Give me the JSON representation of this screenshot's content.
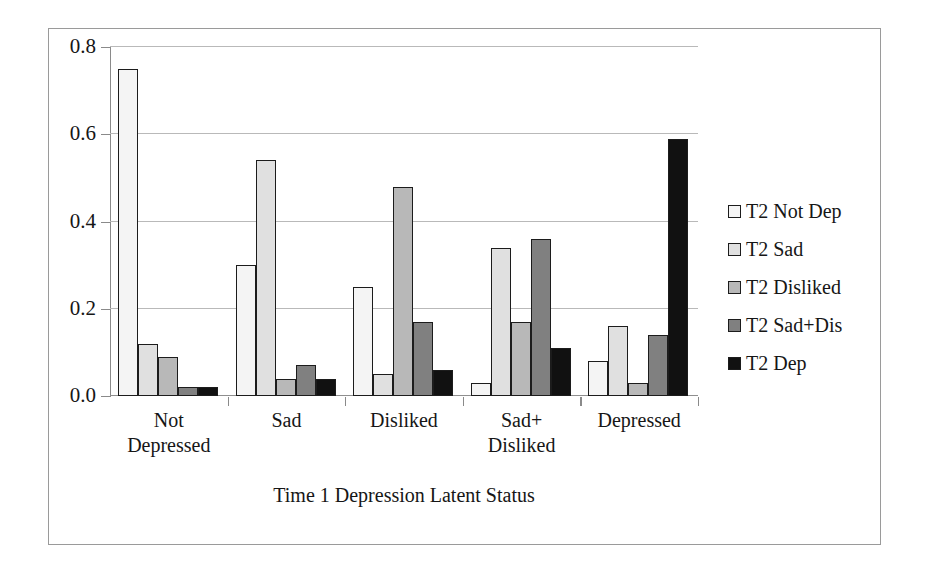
{
  "chart_data": {
    "type": "bar",
    "title": "",
    "xlabel": "Time 1 Depression Latent Status",
    "ylabel": "",
    "ylim": [
      0.0,
      0.8
    ],
    "yticks": [
      "0.0",
      "0.2",
      "0.4",
      "0.6",
      "0.8"
    ],
    "ytick_values": [
      0.0,
      0.2,
      0.4,
      0.6,
      0.8
    ],
    "grid": true,
    "legend_position": "right",
    "categories": [
      "Not Depressed",
      "Sad",
      "Disliked",
      "Sad+ Disliked",
      "Depressed"
    ],
    "category_lines": [
      [
        "Not",
        "Depressed"
      ],
      [
        "Sad",
        ""
      ],
      [
        "Disliked",
        ""
      ],
      [
        "Sad+",
        "Disliked"
      ],
      [
        "Depressed",
        ""
      ]
    ],
    "series": [
      {
        "name": "T2 Not Dep",
        "color": "#f4f4f4",
        "values": [
          0.75,
          0.3,
          0.25,
          0.03,
          0.08
        ]
      },
      {
        "name": "T2 Sad",
        "color": "#e0e0e0",
        "values": [
          0.12,
          0.54,
          0.05,
          0.34,
          0.16
        ]
      },
      {
        "name": "T2 Disliked",
        "color": "#b8b8b8",
        "values": [
          0.09,
          0.04,
          0.48,
          0.17,
          0.03
        ]
      },
      {
        "name": "T2 Sad+Dis",
        "color": "#808080",
        "values": [
          0.02,
          0.07,
          0.17,
          0.36,
          0.14
        ]
      },
      {
        "name": "T2 Dep",
        "color": "#111111",
        "values": [
          0.02,
          0.04,
          0.06,
          0.11,
          0.59
        ]
      }
    ]
  }
}
